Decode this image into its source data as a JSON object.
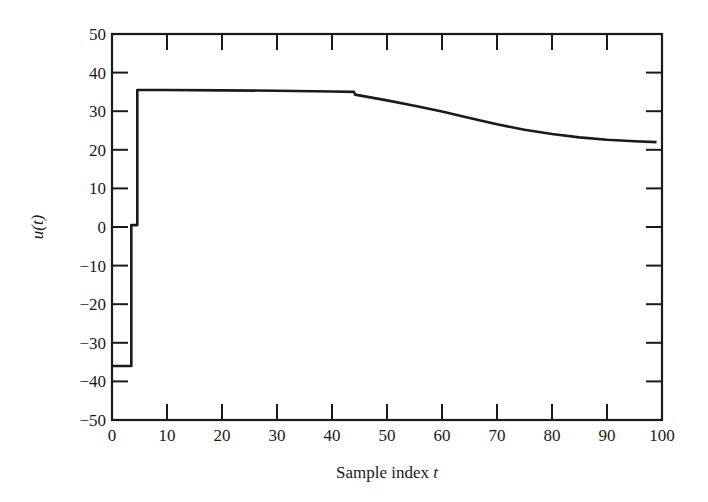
{
  "chart_data": {
    "type": "line",
    "title": "",
    "xlabel": "Sample index t",
    "xlabel_main": "Sample index ",
    "xlabel_var": "t",
    "ylabel": "u(t)",
    "xlim": [
      0,
      100
    ],
    "ylim": [
      -50,
      50
    ],
    "grid": false,
    "legend": null,
    "xticks": [
      0,
      10,
      20,
      30,
      40,
      50,
      60,
      70,
      80,
      90,
      100
    ],
    "yticks": [
      50,
      40,
      30,
      20,
      10,
      0,
      -10,
      -20,
      -30,
      -40,
      -50
    ],
    "ytick_labels": [
      "50",
      "40",
      "30",
      "20",
      "10",
      "0",
      "−10",
      "−20",
      "−30",
      "−40",
      "−50"
    ],
    "series": [
      {
        "name": "u(t)",
        "style": "step-then-smooth",
        "x": [
          0,
          3.5,
          3.5,
          4.6,
          4.6,
          10,
          20,
          30,
          40,
          44,
          44.2,
          50,
          55,
          60,
          65,
          70,
          75,
          80,
          85,
          90,
          95,
          99
        ],
        "values": [
          -36,
          -36,
          0.5,
          0.5,
          35.5,
          35.5,
          35.4,
          35.3,
          35.1,
          35.0,
          34.3,
          32.8,
          31.4,
          29.9,
          28.2,
          26.6,
          25.2,
          24.1,
          23.2,
          22.6,
          22.2,
          22.0
        ]
      }
    ]
  }
}
